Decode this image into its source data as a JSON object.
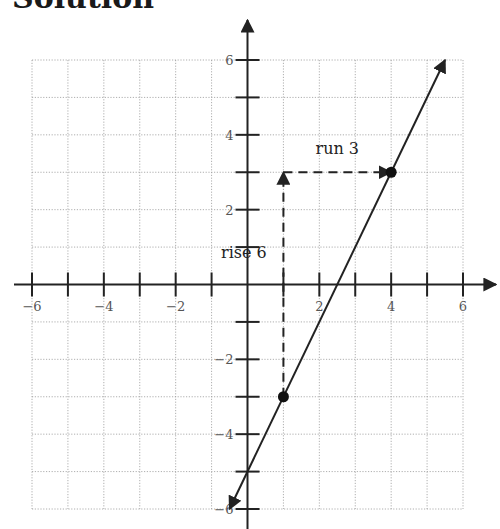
{
  "title": "Solution",
  "chart_data": {
    "type": "line",
    "title": "Solution",
    "xlabel": "",
    "ylabel": "",
    "xlim": [
      -6,
      6
    ],
    "ylim": [
      -6,
      6
    ],
    "grid": true,
    "x_ticks": [
      -6,
      -5,
      -4,
      -3,
      -2,
      -1,
      1,
      2,
      3,
      4,
      5,
      6
    ],
    "y_ticks": [
      -6,
      -5,
      -4,
      -3,
      -2,
      -1,
      1,
      2,
      3,
      4,
      5,
      6
    ],
    "x_tick_labels": [
      "−6",
      "−4",
      "−2",
      "2",
      "4",
      "6"
    ],
    "x_tick_label_values": [
      -6,
      -4,
      -2,
      2,
      4,
      6
    ],
    "y_tick_labels": [
      "6",
      "4",
      "2",
      "−2",
      "−4",
      "−6"
    ],
    "y_tick_label_values": [
      6,
      4,
      2,
      -2,
      -4,
      -6
    ],
    "series": [
      {
        "name": "line y = 2x - 5",
        "x": [
          -0.5,
          5.5
        ],
        "y": [
          -6,
          6
        ],
        "arrows_both_ends": true
      }
    ],
    "points": [
      {
        "x": 1,
        "y": -3
      },
      {
        "x": 4,
        "y": 3
      }
    ],
    "annotations": [
      {
        "text": "rise 6",
        "from": [
          1,
          -3
        ],
        "to": [
          1,
          3
        ],
        "style": "dashed-arrow",
        "label_at": [
          -0.1,
          0.7
        ]
      },
      {
        "text": "run 3",
        "from": [
          1,
          3
        ],
        "to": [
          4,
          3
        ],
        "style": "dashed-arrow",
        "label_at": [
          2.5,
          3.5
        ]
      }
    ]
  }
}
